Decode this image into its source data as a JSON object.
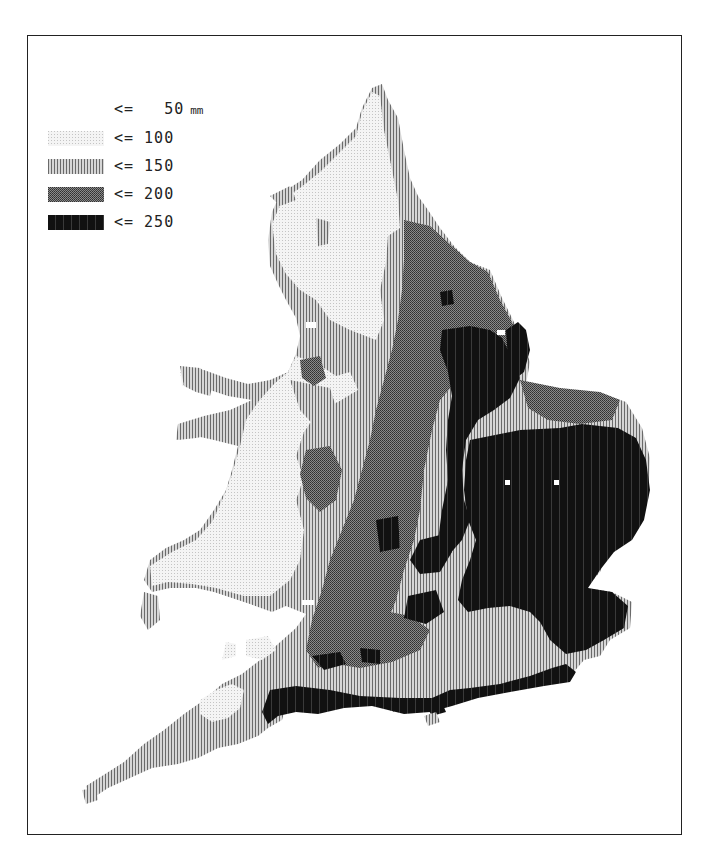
{
  "map": {
    "subject": "England and Wales rainfall map",
    "legend": {
      "items": [
        {
          "op": "<=",
          "value": "50",
          "unit": "mm",
          "class": "c0"
        },
        {
          "op": "<=",
          "value": "100",
          "unit": "",
          "class": "c1"
        },
        {
          "op": "<=",
          "value": "150",
          "unit": "",
          "class": "c2"
        },
        {
          "op": "<=",
          "value": "200",
          "unit": "",
          "class": "c3"
        },
        {
          "op": "<=",
          "value": "250",
          "unit": "",
          "class": "c4"
        }
      ]
    },
    "colors": {
      "c0": "#ffffff",
      "c1": "#e6e6e6",
      "c2": "#a8a8a8",
      "c3": "#6e6e6e",
      "c4": "#141414",
      "frame": "#222222"
    }
  }
}
